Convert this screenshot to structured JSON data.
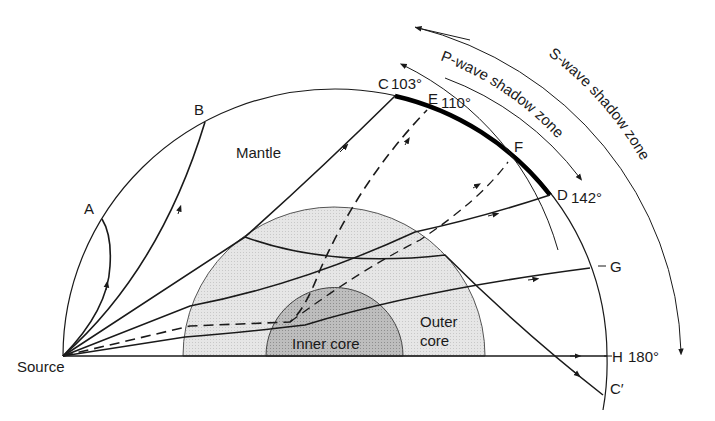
{
  "diagram": {
    "labels": {
      "source": "Source",
      "mantle": "Mantle",
      "inner_core": "Inner core",
      "outer_core_line1": "Outer",
      "outer_core_line2": "core",
      "A": "A",
      "B": "B",
      "C": "C",
      "C_deg": "103°",
      "E": "E",
      "E_deg": "110°",
      "F": "F",
      "D": "D",
      "D_deg": "142°",
      "G": "G",
      "H": "H",
      "H_deg": "180°",
      "C_prime": "C′"
    },
    "zones": {
      "p_wave": "P-wave shadow zone",
      "s_wave": "S-wave shadow zone"
    },
    "colors": {
      "outer_core": "#e4e4e4",
      "inner_core": "#b4b4b4",
      "line": "#1a1a1a"
    }
  }
}
